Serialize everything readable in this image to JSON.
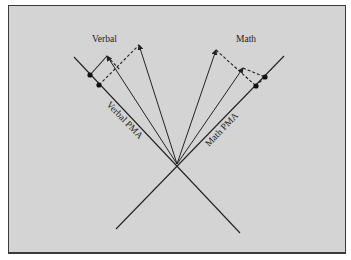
{
  "diagram": {
    "colors": {
      "background": "#d4d4d4",
      "line": "#222222",
      "border": "#3a3a3a"
    },
    "labels": {
      "verbal_title": "Verbal",
      "math_title": "Math",
      "verbal_axis": "Verbal PMA",
      "math_axis": "Math PMA"
    },
    "origin": [
      177,
      164
    ],
    "axes": [
      {
        "name": "verbal-pma-axis",
        "from": [
          74,
          57
        ],
        "to": [
          240,
          233
        ]
      },
      {
        "name": "math-pma-axis",
        "from": [
          284,
          56
        ],
        "to": [
          116,
          229
        ]
      }
    ],
    "vectors": [
      {
        "name": "verbal-vector-1",
        "tip": [
          107,
          56
        ]
      },
      {
        "name": "verbal-vector-2",
        "tip": [
          139,
          45
        ]
      },
      {
        "name": "math-vector-1",
        "tip": [
          216,
          50
        ]
      },
      {
        "name": "math-vector-2",
        "tip": [
          243,
          68
        ]
      }
    ],
    "projection_points": [
      {
        "name": "verbal-proj-1",
        "pt": [
          90,
          75
        ]
      },
      {
        "name": "verbal-proj-2",
        "pt": [
          99,
          85
        ]
      },
      {
        "name": "math-proj-1",
        "pt": [
          265,
          77
        ]
      },
      {
        "name": "math-proj-2",
        "pt": [
          256,
          86
        ]
      }
    ]
  }
}
